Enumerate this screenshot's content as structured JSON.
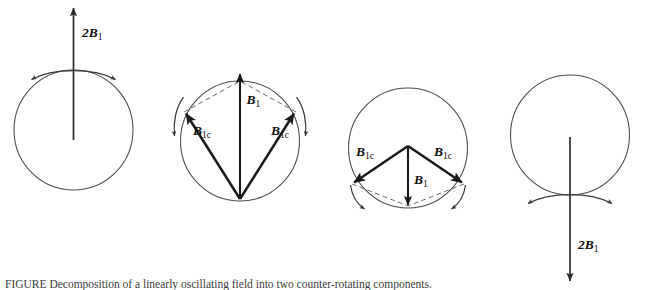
{
  "figure": {
    "domain_type": "diagram",
    "background_color": "#ffffff",
    "stroke_color": "#2b2b2b",
    "circle_color": "#4a4a4a",
    "dashed_color": "#6d6d6d",
    "caption": "FIGURE  Decomposition of a linearly oscillating field into two counter-rotating components."
  },
  "panels": [
    {
      "id": "panel-1",
      "name": "linear-field-up",
      "circle": {
        "cx": 73.5,
        "cy": 130.0,
        "r": 59.5
      },
      "vectors": [
        {
          "name": "field-2b1-up",
          "label_main": "2B",
          "label_sub": "1",
          "x1": 73.5,
          "y1": 140.0,
          "x2": 73.5,
          "y2": 6.0,
          "label_x": 82.0,
          "label_y": 37.0
        }
      ],
      "arc_arrows": [
        {
          "name": "rotation-arc-left",
          "direction": "outward-left"
        },
        {
          "name": "rotation-arc-right",
          "direction": "outward-right"
        }
      ]
    },
    {
      "id": "panel-2",
      "name": "components-up",
      "circle": {
        "cx": 240.0,
        "cy": 141.0,
        "r": 59.5
      },
      "vectors": [
        {
          "name": "field-b1-up",
          "label_main": "B",
          "label_sub": "1",
          "x1": 240.0,
          "y1": 199.0,
          "x2": 240.0,
          "y2": 72.0,
          "label_x": 246.5,
          "label_y": 104.0
        },
        {
          "name": "component-b1c-upleft",
          "label_main": "B",
          "label_sub": "1c",
          "x1": 240.0,
          "y1": 199.0,
          "x2": 184.0,
          "y2": 112.0,
          "label_x": 194.0,
          "label_y": 133.0
        },
        {
          "name": "component-b1c-upright",
          "label_main": "B",
          "label_sub": "1c",
          "x1": 240.0,
          "y1": 199.0,
          "x2": 296.0,
          "y2": 112.0,
          "label_x": 273.0,
          "label_y": 133.0
        }
      ],
      "arc_arrows": [
        {
          "name": "rotation-arc-left",
          "direction": "down-left"
        },
        {
          "name": "rotation-arc-right",
          "direction": "down-right"
        }
      ]
    },
    {
      "id": "panel-3",
      "name": "components-down",
      "circle": {
        "cx": 408.0,
        "cy": 148.0,
        "r": 59.5
      },
      "vectors": [
        {
          "name": "field-b1-down",
          "label_main": "B",
          "label_sub": "1",
          "x1": 408.0,
          "y1": 146.0,
          "x2": 408.0,
          "y2": 207.0,
          "label_x": 414.0,
          "label_y": 183.0
        },
        {
          "name": "component-b1c-downleft",
          "label_main": "B",
          "label_sub": "1c",
          "x1": 408.0,
          "y1": 146.0,
          "x2": 352.0,
          "y2": 184.0,
          "label_x": 358.0,
          "label_y": 155.0
        },
        {
          "name": "component-b1c-downright",
          "label_main": "B",
          "label_sub": "1c",
          "x1": 408.0,
          "y1": 146.0,
          "x2": 464.0,
          "y2": 184.0,
          "label_x": 437.0,
          "label_y": 155.0
        }
      ],
      "arc_arrows": [
        {
          "name": "rotation-arc-left",
          "direction": "down-left"
        },
        {
          "name": "rotation-arc-right",
          "direction": "down-right"
        }
      ]
    },
    {
      "id": "panel-4",
      "name": "linear-field-down",
      "circle": {
        "cx": 570.0,
        "cy": 135.0,
        "r": 59.5
      },
      "vectors": [
        {
          "name": "field-2b1-down",
          "label_main": "2B",
          "label_sub": "1",
          "x1": 570.0,
          "y1": 137.0,
          "x2": 570.0,
          "y2": 283.0,
          "label_x": 578.0,
          "label_y": 249.0
        }
      ],
      "arc_arrows": [
        {
          "name": "rotation-arc-left",
          "direction": "outward-left"
        },
        {
          "name": "rotation-arc-right",
          "direction": "outward-right"
        }
      ]
    }
  ],
  "labels": {
    "p1_2b1_main": "2B",
    "p1_2b1_sub": "1",
    "p2_b1_main": "B",
    "p2_b1_sub": "1",
    "p2_left_main": "B",
    "p2_left_sub": "1c",
    "p2_right_main": "B",
    "p2_right_sub": "1c",
    "p3_b1_main": "B",
    "p3_b1_sub": "1",
    "p3_left_main": "B",
    "p3_left_sub": "1c",
    "p3_right_main": "B",
    "p3_right_sub": "1c",
    "p4_2b1_main": "2B",
    "p4_2b1_sub": "1"
  }
}
